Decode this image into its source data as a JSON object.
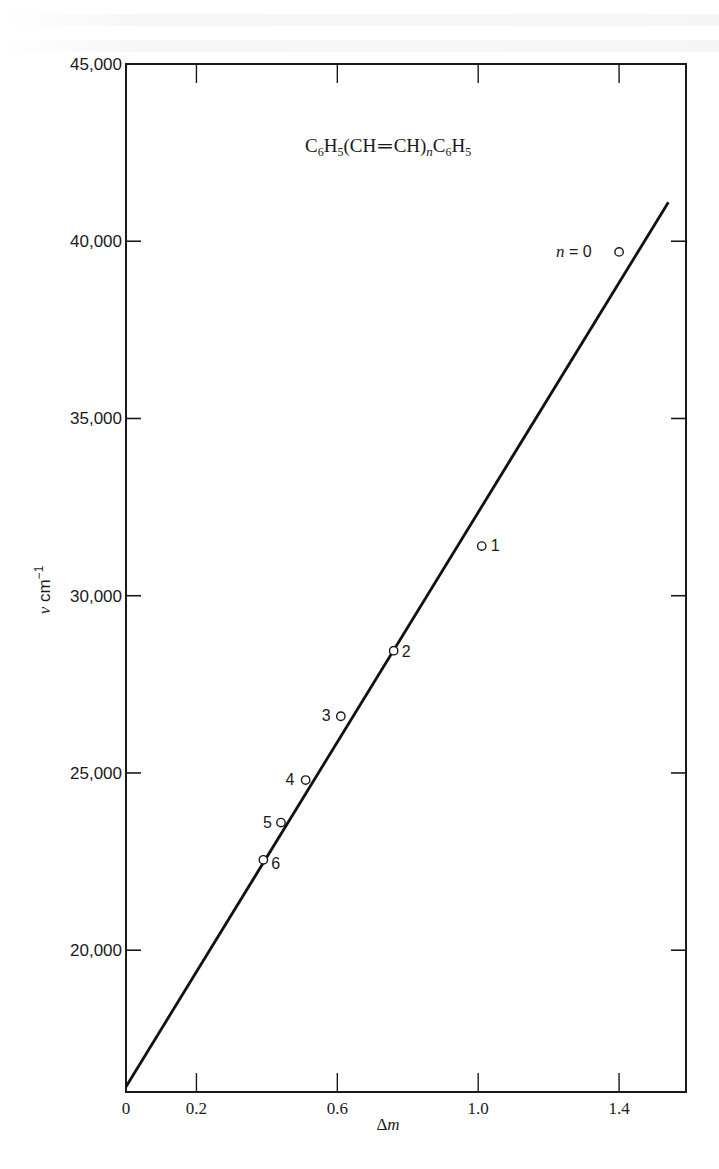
{
  "chart_data": {
    "type": "scatter",
    "title_parts": {
      "c1": "C",
      "s1": "6",
      "h1": "H",
      "s2": "5",
      "mid": "(CH",
      "eq": "═",
      "mid2": "CH)",
      "n": "n",
      "c2": "C",
      "s3": "6",
      "h2": "H",
      "s4": "5"
    },
    "xlabel": "Δm",
    "xlabel_parts": {
      "delta": "Δ",
      "m": "m"
    },
    "ylabel": "ν cm⁻¹",
    "ylabel_parts": {
      "nu": "ν",
      "unit": " cm",
      "exp": "−1"
    },
    "xlim": [
      0,
      1.59
    ],
    "ylim": [
      16000,
      45000
    ],
    "x_ticks": [
      {
        "value": 0,
        "label": "0"
      },
      {
        "value": 0.2,
        "label": "0.2"
      },
      {
        "value": 0.6,
        "label": "0.6"
      },
      {
        "value": 1.0,
        "label": "1.0"
      },
      {
        "value": 1.4,
        "label": "1.4"
      }
    ],
    "y_ticks": [
      {
        "value": 20000,
        "label": "20,000"
      },
      {
        "value": 25000,
        "label": "25,000"
      },
      {
        "value": 30000,
        "label": "30,000"
      },
      {
        "value": 35000,
        "label": "35,000"
      },
      {
        "value": 40000,
        "label": "40,000"
      },
      {
        "value": 45000,
        "label": "45,000"
      }
    ],
    "grid": false,
    "legend": null,
    "series": [
      {
        "name": "observed",
        "marker": "open-circle",
        "points": [
          {
            "n": 0,
            "label": "n = 0",
            "x": 1.4,
            "y": 39700
          },
          {
            "n": 1,
            "label": "1",
            "x": 1.01,
            "y": 31400
          },
          {
            "n": 2,
            "label": "2",
            "x": 0.76,
            "y": 28450
          },
          {
            "n": 3,
            "label": "3",
            "x": 0.61,
            "y": 26600
          },
          {
            "n": 4,
            "label": "4",
            "x": 0.51,
            "y": 24800
          },
          {
            "n": 5,
            "label": "5",
            "x": 0.44,
            "y": 23600
          },
          {
            "n": 6,
            "label": "6",
            "x": 0.39,
            "y": 22550
          }
        ]
      },
      {
        "name": "fit",
        "type": "line",
        "points": [
          {
            "x": 0,
            "y": 16150
          },
          {
            "x": 1.54,
            "y": 41100
          }
        ]
      }
    ],
    "annotations": [
      {
        "text": "C6H5(CH=CH)nC6H5",
        "position": "top-center"
      }
    ]
  }
}
